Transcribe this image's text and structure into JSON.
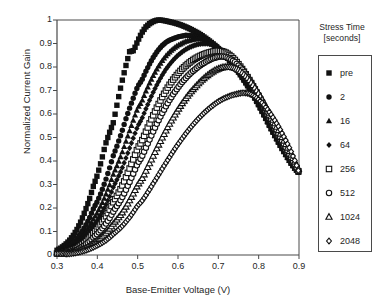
{
  "chart_data": {
    "type": "scatter",
    "title": "",
    "xlabel": "Base-Emitter Voltage (V)",
    "ylabel": "Normalized Current Gain",
    "xlim": [
      0.3,
      0.9
    ],
    "ylim": [
      0,
      1
    ],
    "xticks": [
      "0.3",
      "0.4",
      "0.5",
      "0.6",
      "0.7",
      "0.8",
      "0.9"
    ],
    "xtick_values": [
      0.3,
      0.4,
      0.5,
      0.6,
      0.7,
      0.8,
      0.9
    ],
    "yticks": [
      "0",
      "0.1",
      "0.2",
      "0.3",
      "0.4",
      "0.5",
      "0.6",
      "0.7",
      "0.8",
      "0.9",
      "1"
    ],
    "ytick_values": [
      0,
      0.1,
      0.2,
      0.3,
      0.4,
      0.5,
      0.6,
      0.7,
      0.8,
      0.9,
      1.0
    ],
    "grid": false,
    "legend_position": "right",
    "legend_title": "Stress Time [seconds]",
    "legend_title_line1": "Stress Time",
    "legend_title_line2": "[seconds]",
    "x": [
      0.3,
      0.31,
      0.32,
      0.33,
      0.34,
      0.35,
      0.36,
      0.37,
      0.38,
      0.39,
      0.4,
      0.41,
      0.42,
      0.43,
      0.44,
      0.45,
      0.46,
      0.47,
      0.48,
      0.49,
      0.5,
      0.51,
      0.52,
      0.53,
      0.54,
      0.55,
      0.56,
      0.57,
      0.58,
      0.59,
      0.6,
      0.61,
      0.62,
      0.63,
      0.64,
      0.65,
      0.66,
      0.67,
      0.68,
      0.69,
      0.7,
      0.71,
      0.72,
      0.73,
      0.74,
      0.75,
      0.76,
      0.77,
      0.78,
      0.79,
      0.8,
      0.81,
      0.82,
      0.83,
      0.84,
      0.85,
      0.86,
      0.87,
      0.88,
      0.89,
      0.9
    ],
    "series": [
      {
        "name": "pre",
        "marker": "filled-square",
        "color": "#111111",
        "peak_x": 0.55,
        "peak_y": 1.0,
        "values": [
          0.02,
          0.03,
          0.043,
          0.06,
          0.082,
          0.11,
          0.145,
          0.188,
          0.235,
          0.292,
          0.34,
          0.4,
          0.47,
          0.52,
          0.565,
          0.65,
          0.73,
          0.8,
          0.865,
          0.87,
          0.91,
          0.945,
          0.97,
          0.985,
          0.995,
          1.0,
          0.999,
          0.996,
          0.992,
          0.988,
          0.983,
          0.977,
          0.97,
          0.962,
          0.953,
          0.944,
          0.933,
          0.921,
          0.908,
          0.894,
          0.878,
          0.861,
          0.843,
          0.823,
          0.801,
          0.778,
          0.753,
          0.727,
          0.699,
          0.669,
          0.638,
          0.606,
          0.573,
          0.54,
          0.508,
          0.477,
          0.447,
          0.419,
          0.392,
          0.368,
          0.35
        ]
      },
      {
        "name": "2",
        "marker": "filled-circle",
        "color": "#111111",
        "peak_x": 0.62,
        "peak_y": 0.935,
        "values": [
          0.013,
          0.019,
          0.027,
          0.038,
          0.052,
          0.07,
          0.094,
          0.122,
          0.156,
          0.196,
          0.228,
          0.268,
          0.315,
          0.368,
          0.425,
          0.47,
          0.52,
          0.575,
          0.625,
          0.672,
          0.718,
          0.742,
          0.78,
          0.815,
          0.845,
          0.87,
          0.89,
          0.905,
          0.915,
          0.922,
          0.928,
          0.932,
          0.935,
          0.934,
          0.931,
          0.927,
          0.921,
          0.913,
          0.903,
          0.891,
          0.877,
          0.861,
          0.843,
          0.823,
          0.801,
          0.778,
          0.753,
          0.727,
          0.699,
          0.669,
          0.638,
          0.606,
          0.573,
          0.54,
          0.508,
          0.477,
          0.447,
          0.419,
          0.392,
          0.368,
          0.35
        ]
      },
      {
        "name": "16",
        "marker": "filled-triangle",
        "color": "#111111",
        "peak_x": 0.645,
        "peak_y": 0.92,
        "values": [
          0.01,
          0.014,
          0.02,
          0.028,
          0.039,
          0.053,
          0.071,
          0.093,
          0.12,
          0.152,
          0.18,
          0.213,
          0.252,
          0.296,
          0.345,
          0.385,
          0.428,
          0.478,
          0.528,
          0.578,
          0.625,
          0.652,
          0.695,
          0.733,
          0.768,
          0.798,
          0.825,
          0.847,
          0.865,
          0.88,
          0.892,
          0.901,
          0.909,
          0.914,
          0.918,
          0.92,
          0.919,
          0.915,
          0.908,
          0.898,
          0.885,
          0.869,
          0.851,
          0.831,
          0.809,
          0.785,
          0.759,
          0.732,
          0.703,
          0.673,
          0.641,
          0.608,
          0.575,
          0.541,
          0.509,
          0.478,
          0.448,
          0.419,
          0.392,
          0.368,
          0.35
        ]
      },
      {
        "name": "64",
        "marker": "filled-diamond",
        "color": "#111111",
        "peak_x": 0.665,
        "peak_y": 0.9,
        "values": [
          0.008,
          0.011,
          0.016,
          0.022,
          0.031,
          0.042,
          0.057,
          0.075,
          0.097,
          0.124,
          0.148,
          0.176,
          0.209,
          0.247,
          0.29,
          0.325,
          0.363,
          0.408,
          0.455,
          0.502,
          0.548,
          0.578,
          0.62,
          0.66,
          0.698,
          0.732,
          0.763,
          0.79,
          0.813,
          0.833,
          0.85,
          0.864,
          0.876,
          0.885,
          0.892,
          0.897,
          0.899,
          0.9,
          0.897,
          0.891,
          0.882,
          0.869,
          0.853,
          0.834,
          0.812,
          0.788,
          0.762,
          0.734,
          0.705,
          0.674,
          0.642,
          0.609,
          0.576,
          0.542,
          0.51,
          0.478,
          0.448,
          0.419,
          0.392,
          0.368,
          0.35
        ]
      },
      {
        "name": "256",
        "marker": "open-square",
        "color": "#111111",
        "peak_x": 0.685,
        "peak_y": 0.87,
        "values": [
          0.006,
          0.008,
          0.011,
          0.016,
          0.022,
          0.03,
          0.041,
          0.055,
          0.072,
          0.093,
          0.112,
          0.134,
          0.16,
          0.191,
          0.226,
          0.256,
          0.288,
          0.327,
          0.368,
          0.411,
          0.455,
          0.483,
          0.523,
          0.562,
          0.6,
          0.636,
          0.669,
          0.7,
          0.727,
          0.751,
          0.772,
          0.791,
          0.807,
          0.821,
          0.833,
          0.843,
          0.851,
          0.858,
          0.863,
          0.867,
          0.869,
          0.867,
          0.86,
          0.848,
          0.832,
          0.812,
          0.789,
          0.764,
          0.736,
          0.706,
          0.675,
          0.642,
          0.608,
          0.574,
          0.54,
          0.507,
          0.475,
          0.443,
          0.412,
          0.382,
          0.352
        ]
      },
      {
        "name": "512",
        "marker": "open-circle",
        "color": "#111111",
        "peak_x": 0.7,
        "peak_y": 0.845,
        "values": [
          0.005,
          0.006,
          0.009,
          0.012,
          0.017,
          0.023,
          0.032,
          0.043,
          0.057,
          0.074,
          0.09,
          0.108,
          0.13,
          0.156,
          0.186,
          0.212,
          0.24,
          0.274,
          0.311,
          0.35,
          0.39,
          0.417,
          0.455,
          0.493,
          0.531,
          0.567,
          0.601,
          0.633,
          0.662,
          0.689,
          0.713,
          0.735,
          0.754,
          0.772,
          0.787,
          0.801,
          0.813,
          0.823,
          0.832,
          0.839,
          0.844,
          0.845,
          0.842,
          0.834,
          0.822,
          0.806,
          0.787,
          0.764,
          0.738,
          0.71,
          0.68,
          0.648,
          0.615,
          0.581,
          0.547,
          0.513,
          0.48,
          0.448,
          0.416,
          0.384,
          0.352
        ]
      },
      {
        "name": "1024",
        "marker": "open-triangle",
        "color": "#111111",
        "peak_x": 0.73,
        "peak_y": 0.8,
        "values": [
          0.003,
          0.004,
          0.006,
          0.008,
          0.011,
          0.015,
          0.021,
          0.028,
          0.038,
          0.05,
          0.062,
          0.075,
          0.091,
          0.11,
          0.133,
          0.153,
          0.175,
          0.202,
          0.232,
          0.264,
          0.298,
          0.322,
          0.356,
          0.391,
          0.427,
          0.462,
          0.496,
          0.529,
          0.561,
          0.59,
          0.618,
          0.644,
          0.668,
          0.69,
          0.71,
          0.728,
          0.745,
          0.76,
          0.773,
          0.784,
          0.792,
          0.798,
          0.8,
          0.8,
          0.796,
          0.788,
          0.775,
          0.758,
          0.737,
          0.713,
          0.686,
          0.657,
          0.626,
          0.593,
          0.56,
          0.527,
          0.494,
          0.461,
          0.428,
          0.395,
          0.36
        ]
      },
      {
        "name": "2048",
        "marker": "open-diamond",
        "color": "#111111",
        "peak_x": 0.76,
        "peak_y": 0.69,
        "values": [
          0.002,
          0.003,
          0.004,
          0.005,
          0.007,
          0.01,
          0.014,
          0.019,
          0.025,
          0.033,
          0.041,
          0.05,
          0.061,
          0.074,
          0.09,
          0.104,
          0.12,
          0.139,
          0.16,
          0.184,
          0.21,
          0.228,
          0.253,
          0.28,
          0.308,
          0.336,
          0.364,
          0.392,
          0.419,
          0.446,
          0.471,
          0.495,
          0.518,
          0.54,
          0.56,
          0.579,
          0.597,
          0.613,
          0.628,
          0.641,
          0.653,
          0.663,
          0.671,
          0.678,
          0.683,
          0.687,
          0.69,
          0.689,
          0.684,
          0.675,
          0.662,
          0.645,
          0.624,
          0.6,
          0.573,
          0.544,
          0.512,
          0.478,
          0.442,
          0.4,
          0.352
        ]
      }
    ]
  },
  "legend": {
    "title_line1": "Stress Time",
    "title_line2": "[seconds]",
    "items": [
      {
        "label": "pre",
        "marker": "filled-square"
      },
      {
        "label": "2",
        "marker": "filled-circle"
      },
      {
        "label": "16",
        "marker": "filled-triangle"
      },
      {
        "label": "64",
        "marker": "filled-diamond"
      },
      {
        "label": "256",
        "marker": "open-square"
      },
      {
        "label": "512",
        "marker": "open-circle"
      },
      {
        "label": "1024",
        "marker": "open-triangle"
      },
      {
        "label": "2048",
        "marker": "open-diamond"
      }
    ]
  },
  "colors": {
    "axis": "#4a4a4a",
    "marker": "#111111",
    "text": "#262626",
    "background": "#ffffff"
  }
}
